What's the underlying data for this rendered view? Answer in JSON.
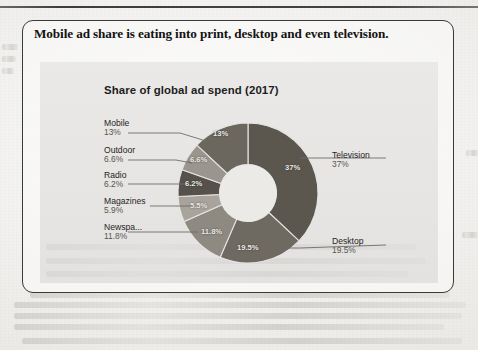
{
  "page": {
    "headline": "Mobile ad share is eating into print, desktop and even television.",
    "margin_ghost_text": "",
    "top_rule": "horizontal-rule"
  },
  "chart_data": {
    "type": "pie",
    "variant": "donut",
    "title": "Share of global ad spend (2017)",
    "xlabel": "",
    "ylabel": "",
    "units": "percent",
    "legend_position": "leader-lines",
    "grid": false,
    "categories": [
      "Television",
      "Desktop",
      "Newspapers",
      "Magazines",
      "Radio",
      "Outdoor",
      "Mobile"
    ],
    "values": [
      37,
      19.5,
      11.8,
      5.9,
      6.2,
      6.6,
      13
    ],
    "slices": [
      {
        "label": "Television",
        "label_display": "Television",
        "value": 37,
        "value_text": "37%",
        "slice_text": "37%",
        "color": "#5b574f"
      },
      {
        "label": "Desktop",
        "label_display": "Desktop",
        "value": 19.5,
        "value_text": "19.5%",
        "slice_text": "19.5%",
        "color": "#6e6a62"
      },
      {
        "label": "Newspapers",
        "label_display": "Newspa...",
        "value": 11.8,
        "value_text": "11.8%",
        "slice_text": "11.8%",
        "color": "#8e8a82"
      },
      {
        "label": "Magazines",
        "label_display": "Magazines",
        "value": 5.9,
        "value_text": "5.9%",
        "slice_text": "5.5%",
        "color": "#a8a49c"
      },
      {
        "label": "Radio",
        "label_display": "Radio",
        "value": 6.2,
        "value_text": "6.2%",
        "slice_text": "6.2%",
        "color": "#56524b"
      },
      {
        "label": "Outdoor",
        "label_display": "Outdoor",
        "value": 6.6,
        "value_text": "6.6%",
        "slice_text": "6.6%",
        "color": "#9a968e"
      },
      {
        "label": "Mobile",
        "label_display": "Mobile",
        "value": 13,
        "value_text": "13%",
        "slice_text": "13%",
        "color": "#6b675f"
      }
    ]
  },
  "colors": {
    "paper": "#f3f2f0",
    "panel": "#e6e5e3",
    "ink": "#131313",
    "border": "#3a3a3a",
    "hole": "#eceae7"
  }
}
